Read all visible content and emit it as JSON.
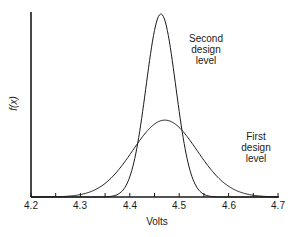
{
  "chart_data": {
    "type": "line",
    "title": "",
    "xlabel": "Volts",
    "ylabel": "f(x)",
    "xlim": [
      4.2,
      4.7
    ],
    "x_ticks": [
      "4.2",
      "4.3",
      "4.4",
      "4.5",
      "4.6",
      "4.7"
    ],
    "minor_tick_step": 0.05,
    "grid": false,
    "legend": "none (inline annotations)",
    "series": [
      {
        "name": "Second design level",
        "distribution": "normal",
        "mean": 4.463,
        "sigma": 0.03,
        "relative_peak_height": 1.0,
        "annotation": [
          "Second",
          "design",
          "level"
        ]
      },
      {
        "name": "First design level",
        "distribution": "normal",
        "mean": 4.471,
        "sigma": 0.065,
        "relative_peak_height": 0.42,
        "annotation": [
          "First",
          "design",
          "level"
        ]
      }
    ]
  },
  "labels": {
    "second_1": "Second",
    "second_2": "design",
    "second_3": "level",
    "first_1": "First",
    "first_2": "design",
    "first_3": "level",
    "xlabel": "Volts",
    "ylabel": "f(x)",
    "t0": "4.2",
    "t1": "4.3",
    "t2": "4.4",
    "t3": "4.5",
    "t4": "4.6",
    "t5": "4.7"
  }
}
